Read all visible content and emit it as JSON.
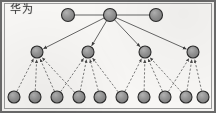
{
  "figure": {
    "caption": "华为",
    "width": 216,
    "height": 113,
    "background_color": "#f7f6f4",
    "frame_color": "#6a6a6a",
    "node_fill": "#8c8c8c",
    "node_stroke": "#2b2b2b",
    "solid_edge_color": "#4a4a4a",
    "dashed_edge_color": "#5a5a5a"
  },
  "graph": {
    "type": "hierarchy-tree",
    "level_count": 3,
    "node_radius": {
      "level0": 6.5,
      "level1": 6.0,
      "level2": 6.0
    },
    "levels": [
      {
        "name": "level-0-top",
        "y": 15,
        "node_count": 3,
        "nodes": [
          {
            "id": "t1",
            "x": 68,
            "y": 15,
            "label": ""
          },
          {
            "id": "t2",
            "x": 110,
            "y": 15,
            "label": ""
          },
          {
            "id": "t3",
            "x": 156,
            "y": 15,
            "label": ""
          }
        ]
      },
      {
        "name": "level-1-middle",
        "y": 52,
        "node_count": 4,
        "nodes": [
          {
            "id": "m1",
            "x": 37,
            "y": 52,
            "label": ""
          },
          {
            "id": "m2",
            "x": 88,
            "y": 52,
            "label": ""
          },
          {
            "id": "m3",
            "x": 145,
            "y": 52,
            "label": ""
          },
          {
            "id": "m4",
            "x": 193,
            "y": 52,
            "label": ""
          }
        ]
      },
      {
        "name": "level-2-bottom",
        "y": 97,
        "node_count": 10,
        "nodes": [
          {
            "id": "b1",
            "x": 14,
            "y": 97,
            "label": ""
          },
          {
            "id": "b2",
            "x": 35,
            "y": 97,
            "label": ""
          },
          {
            "id": "b3",
            "x": 57,
            "y": 97,
            "label": ""
          },
          {
            "id": "b4",
            "x": 79,
            "y": 97,
            "label": ""
          },
          {
            "id": "b5",
            "x": 100,
            "y": 97,
            "label": ""
          },
          {
            "id": "b6",
            "x": 122,
            "y": 97,
            "label": ""
          },
          {
            "id": "b7",
            "x": 144,
            "y": 97,
            "label": ""
          },
          {
            "id": "b8",
            "x": 165,
            "y": 97,
            "label": ""
          },
          {
            "id": "b9",
            "x": 186,
            "y": 97,
            "label": ""
          },
          {
            "id": "b10",
            "x": 203,
            "y": 97,
            "label": ""
          }
        ]
      }
    ],
    "solid_edges": [
      {
        "from": "t1",
        "to": "t2"
      },
      {
        "from": "t2",
        "to": "t3"
      },
      {
        "from": "t2",
        "to": "m1"
      },
      {
        "from": "t2",
        "to": "m2"
      },
      {
        "from": "t2",
        "to": "m3"
      },
      {
        "from": "t2",
        "to": "m4"
      }
    ],
    "dashed_edges": [
      {
        "from": "b1",
        "to": "m1"
      },
      {
        "from": "b2",
        "to": "m1"
      },
      {
        "from": "b3",
        "to": "m1"
      },
      {
        "from": "b4",
        "to": "m1"
      },
      {
        "from": "b3",
        "to": "m2"
      },
      {
        "from": "b4",
        "to": "m2"
      },
      {
        "from": "b5",
        "to": "m2"
      },
      {
        "from": "b6",
        "to": "m2"
      },
      {
        "from": "b6",
        "to": "m3"
      },
      {
        "from": "b7",
        "to": "m3"
      },
      {
        "from": "b8",
        "to": "m3"
      },
      {
        "from": "b9",
        "to": "m3"
      },
      {
        "from": "b8",
        "to": "m4"
      },
      {
        "from": "b9",
        "to": "m4"
      },
      {
        "from": "b10",
        "to": "m4"
      }
    ],
    "arrowheads": {
      "dashed_edges_point_to": "parent",
      "solid_child_edges_point_to": "root"
    }
  }
}
